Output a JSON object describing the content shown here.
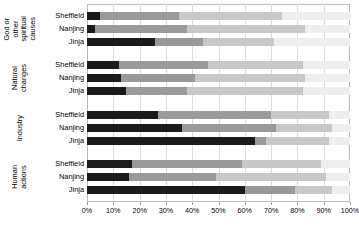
{
  "chart_data": {
    "type": "bar",
    "orientation": "horizontal",
    "stacked": true,
    "stack_mode": "percent",
    "title": "",
    "subtitle": "",
    "xlabel": "",
    "ylabel": "",
    "xlim": [
      0,
      100
    ],
    "xticks": [
      0,
      10,
      20,
      30,
      40,
      50,
      60,
      70,
      80,
      90,
      100
    ],
    "xticklabels": [
      "0%",
      "10%",
      "20%",
      "30%",
      "40%",
      "50%",
      "60%",
      "70%",
      "80%",
      "90%",
      "100%"
    ],
    "grid": true,
    "grid_axis": "x",
    "legend": "none",
    "series": [
      {
        "name": "segment-1",
        "color": "#1a1a1a"
      },
      {
        "name": "segment-2",
        "color": "#9a9a9a"
      },
      {
        "name": "segment-3",
        "color": "#c8c8c8"
      },
      {
        "name": "segment-4",
        "color": "#eeeeee"
      }
    ],
    "groups": [
      {
        "category": "God or other spiritual causes",
        "category_lines": "God or\nother\nspiritual\ncauses",
        "rows": [
          {
            "city": "Sheffield",
            "values": [
              5,
              30,
              39,
              26
            ]
          },
          {
            "city": "Nanjing",
            "values": [
              3,
              35,
              45,
              17
            ]
          },
          {
            "city": "Jinja",
            "values": [
              26,
              18,
              27,
              29
            ]
          }
        ]
      },
      {
        "category": "Natural changes",
        "category_lines": "Natural\nchanges",
        "rows": [
          {
            "city": "Sheffield",
            "values": [
              12,
              34,
              36,
              18
            ]
          },
          {
            "city": "Nanjing",
            "values": [
              13,
              28,
              42,
              17
            ]
          },
          {
            "city": "Jinja",
            "values": [
              15,
              23,
              44,
              18
            ]
          }
        ]
      },
      {
        "category": "Industry",
        "category_lines": "Industry",
        "rows": [
          {
            "city": "Sheffield",
            "values": [
              27,
              43,
              22,
              8
            ]
          },
          {
            "city": "Nanjing",
            "values": [
              36,
              36,
              21,
              7
            ]
          },
          {
            "city": "Jinja",
            "values": [
              64,
              4,
              24,
              8
            ]
          }
        ]
      },
      {
        "category": "Human actions",
        "category_lines": "Human\nactions",
        "rows": [
          {
            "city": "Sheffield",
            "values": [
              17,
              42,
              30,
              11
            ]
          },
          {
            "city": "Nanjing",
            "values": [
              16,
              33,
              42,
              9
            ]
          },
          {
            "city": "Jinja",
            "values": [
              60,
              19,
              14,
              7
            ]
          }
        ]
      }
    ]
  }
}
